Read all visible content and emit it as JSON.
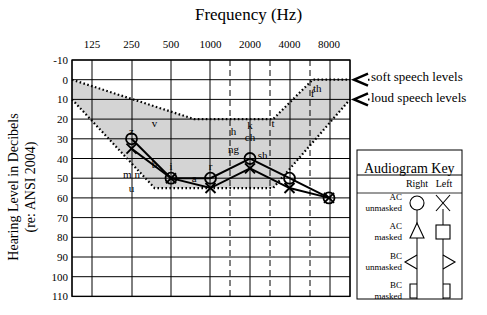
{
  "chart_data": {
    "type": "line",
    "title": "Frequency (Hz)",
    "xlabel": "Frequency (Hz)",
    "ylabel": "Hearing Level in Decibels",
    "ylabel_sub": "(re: ANSI 2004)",
    "x": [
      "125",
      "250",
      "500",
      "1000",
      "2000",
      "4000",
      "8000"
    ],
    "y_ticks": [
      "-10",
      "0",
      "10",
      "20",
      "30",
      "40",
      "50",
      "60",
      "70",
      "80",
      "90",
      "100",
      "110"
    ],
    "ylim": [
      -10,
      110
    ],
    "y_inverted": true,
    "grid": true,
    "series": [
      {
        "name": "Right AC unmasked",
        "marker": "circle",
        "x": [
          "250",
          "500",
          "1000",
          "2000",
          "4000",
          "8000"
        ],
        "values": [
          30,
          50,
          50,
          40,
          50,
          60
        ]
      },
      {
        "name": "Left AC unmasked",
        "marker": "x",
        "x": [
          "250",
          "500",
          "1000",
          "2000",
          "4000",
          "8000"
        ],
        "values": [
          35,
          50,
          55,
          45,
          55,
          60
        ]
      }
    ],
    "speech_banana": {
      "upper": [
        [
          "125",
          0
        ],
        [
          "750",
          20
        ],
        [
          "3000",
          20
        ],
        [
          "6000",
          0
        ],
        [
          "12000",
          0
        ]
      ],
      "lower": [
        [
          "125",
          10
        ],
        [
          "375",
          55
        ],
        [
          "3000",
          55
        ],
        [
          "12000",
          10
        ]
      ]
    },
    "annotations": [
      "soft speech levels",
      "loud speech levels"
    ],
    "phonemes": [
      {
        "t": "v",
        "f": "375",
        "db": 22
      },
      {
        "t": "z",
        "f": "250",
        "db": 26
      },
      {
        "t": "b",
        "f": "375",
        "db": 43
      },
      {
        "t": "i",
        "f": "500",
        "db": 44
      },
      {
        "t": "a",
        "f": "750",
        "db": 50
      },
      {
        "t": "r",
        "f": "1000",
        "db": 44
      },
      {
        "t": "m n",
        "f": "250",
        "db": 48
      },
      {
        "t": "u",
        "f": "250",
        "db": 55
      },
      {
        "t": "h",
        "f": "1500",
        "db": 26
      },
      {
        "t": "k",
        "f": "2000",
        "db": 23
      },
      {
        "t": "ch",
        "f": "2000",
        "db": 29
      },
      {
        "t": "ng",
        "f": "1500",
        "db": 35
      },
      {
        "t": "sh",
        "f": "2500",
        "db": 38
      },
      {
        "t": "t",
        "f": "3000",
        "db": 22
      },
      {
        "t": "f",
        "f": "6000",
        "db": 7
      },
      {
        "t": "th",
        "f": "6500",
        "db": 4
      }
    ]
  },
  "key": {
    "title": "Audiogram Key",
    "columns": [
      "Right",
      "Left"
    ],
    "rows": [
      {
        "line1": "AC",
        "line2": "unmasked",
        "right": "circle",
        "left": "x"
      },
      {
        "line1": "AC",
        "line2": "masked",
        "right": "triangle",
        "left": "square"
      },
      {
        "line1": "BC",
        "line2": "unmasked",
        "right": "bracket-left-angle",
        "left": "bracket-right-angle"
      },
      {
        "line1": "BC",
        "line2": "masked",
        "right": "bracket-left-square",
        "left": "bracket-right-square"
      }
    ]
  }
}
